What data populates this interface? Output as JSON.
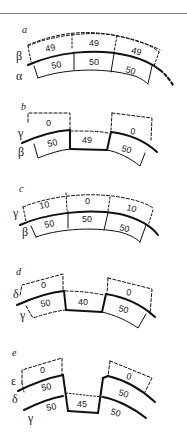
{
  "figure": {
    "panels": [
      {
        "id": "a",
        "layers": [
          "β",
          "α"
        ],
        "top_values": [
          "49",
          "49",
          "49"
        ],
        "bottom_values": [
          "50",
          "50",
          "50"
        ]
      },
      {
        "id": "b",
        "layers": [
          "γ",
          "β"
        ],
        "top_values": [
          "0",
          "",
          "0"
        ],
        "bottom_values": [
          "50",
          "49",
          "50"
        ]
      },
      {
        "id": "c",
        "layers": [
          "γ",
          "β"
        ],
        "top_values": [
          "10",
          "0",
          "10"
        ],
        "bottom_values": [
          "50",
          "50",
          "50"
        ]
      },
      {
        "id": "d",
        "layers": [
          "δ",
          "γ"
        ],
        "top_values": [
          "0",
          "",
          "0"
        ],
        "bottom_values": [
          "50",
          "40",
          "50"
        ]
      },
      {
        "id": "e",
        "layers": [
          "ε",
          "δ",
          "γ"
        ],
        "top_values": [
          "0",
          "",
          "0"
        ],
        "middle_values": [
          "50",
          "",
          "50"
        ],
        "bottom_values": [
          "50",
          "45",
          "50"
        ]
      }
    ]
  },
  "colors": {
    "line": "#111111",
    "background": "#ffffff",
    "rule": "#8a8a8a"
  }
}
